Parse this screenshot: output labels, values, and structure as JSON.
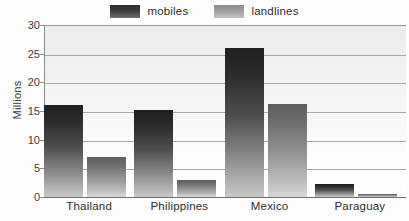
{
  "chart_data": {
    "type": "bar",
    "title": "",
    "xlabel": "",
    "ylabel": "Millions",
    "ylim": [
      0,
      30
    ],
    "ytick_step": 5,
    "grid": true,
    "legend_position": "top-center",
    "categories": [
      "Thailand",
      "Philippines",
      "Mexico",
      "Paraguay"
    ],
    "series": [
      {
        "name": "mobiles",
        "values": [
          16.0,
          15.2,
          26.0,
          2.3
        ]
      },
      {
        "name": "landlines",
        "values": [
          7.0,
          3.0,
          16.3,
          0.6
        ]
      }
    ],
    "ytick_labels": [
      "0",
      "5",
      "10",
      "15",
      "20",
      "25",
      "30"
    ],
    "ytick_values": [
      0,
      5,
      10,
      15,
      20,
      25,
      30
    ]
  },
  "legend": {
    "entries": [
      {
        "label": "mobiles",
        "swatch": "mobiles-swatch-icon",
        "color": "#2b2b2b"
      },
      {
        "label": "landlines",
        "swatch": "landlines-swatch-icon",
        "color": "#9a9a9a"
      }
    ]
  },
  "axes": {
    "y_title": "Millions"
  },
  "colors": {
    "mobiles_dark": "#1f1f1f",
    "mobiles_light": "#c9c9c9",
    "landlines_dark": "#5e5e5e",
    "landlines_light": "#d8d8d8",
    "gridline": "#a8a8a8",
    "axis": "#6f6f6f",
    "plot_background": "#f2f2f2",
    "text": "#2e2e2e"
  }
}
